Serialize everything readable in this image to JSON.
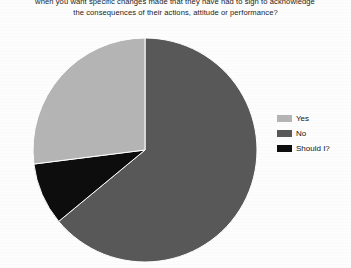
{
  "document": {
    "caption_lines": [
      "when you want specific changes made that they have had to sign to acknowledge",
      "the consequences of their actions, attitude or performance?"
    ]
  },
  "chart_data": {
    "type": "pie",
    "title": "",
    "subtitle": "",
    "xlabel": "",
    "ylabel": "",
    "grid": false,
    "legend_position": "right",
    "start_angle_deg": 0,
    "direction": "clockwise",
    "categories": [
      "No",
      "Should I?",
      "Yes"
    ],
    "values": [
      64,
      9,
      27
    ],
    "value_unit": "percent",
    "colors": [
      "#585858",
      "#0d0d0d",
      "#b4b4b4"
    ],
    "slices": [
      {
        "label": "No",
        "value": 64,
        "color": "#585858"
      },
      {
        "label": "Should I?",
        "value": 9,
        "color": "#0d0d0d"
      },
      {
        "label": "Yes",
        "value": 27,
        "color": "#b4b4b4"
      }
    ],
    "legend": [
      {
        "label": "Yes",
        "color": "#b4b4b4"
      },
      {
        "label": "No",
        "color": "#585858"
      },
      {
        "label": "Should I?",
        "color": "#0d0d0d"
      }
    ],
    "annotations": []
  }
}
